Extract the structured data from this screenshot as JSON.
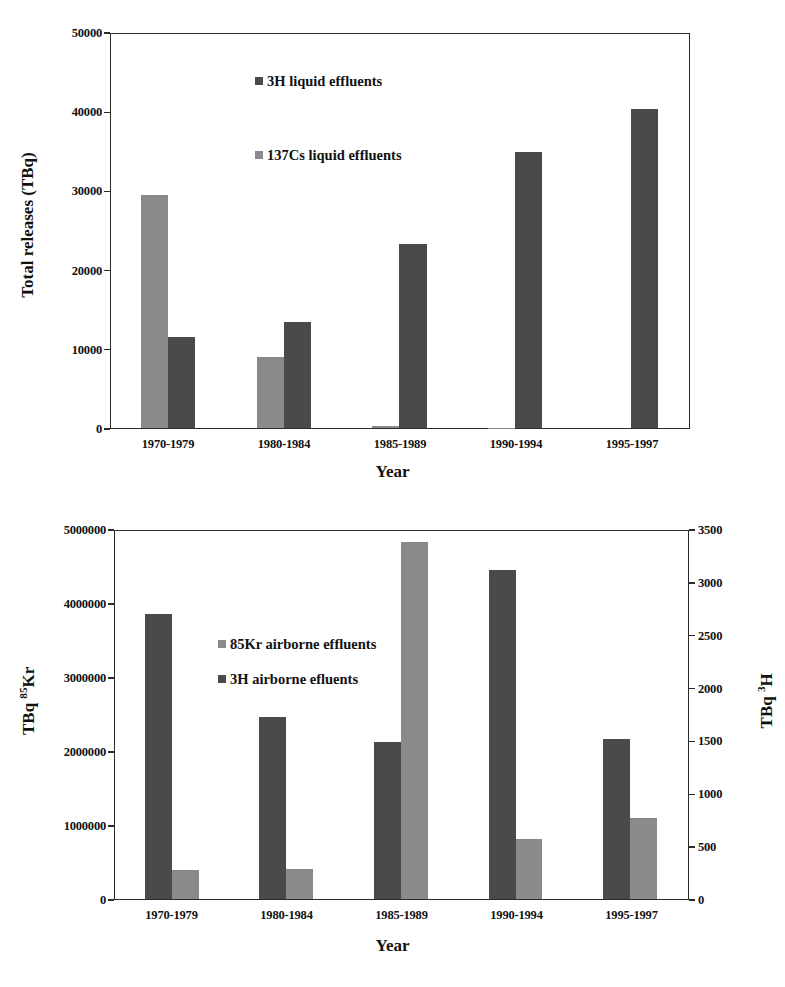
{
  "figure": {
    "accent_dark": "#4a4a4a",
    "accent_light": "#8a8a8a",
    "axis_color": "#2b2b2b"
  },
  "chart_data": [
    {
      "id": "liquid-effluents",
      "type": "bar",
      "title": "",
      "xlabel": "Year",
      "ylabel": "Total releases (TBq)",
      "categories": [
        "1970-1979",
        "1980-1984",
        "1985-1989",
        "1990-1994",
        "1995-1997"
      ],
      "ylim": [
        0,
        50000
      ],
      "yticks": [
        "0",
        "10000",
        "20000",
        "30000",
        "40000",
        "50000"
      ],
      "ytick_values": [
        0,
        10000,
        20000,
        30000,
        40000,
        50000
      ],
      "grid": false,
      "legend_position": "inside-top-left",
      "series": [
        {
          "name": "3H liquid effluents",
          "color": "#4a4a4a",
          "axis": "left",
          "values": [
            11600,
            13500,
            23400,
            35000,
            40500
          ]
        },
        {
          "name": "137Cs liquid effluents",
          "color": "#8a8a8a",
          "axis": "left",
          "values": [
            29600,
            9000,
            300,
            50,
            0
          ]
        }
      ]
    },
    {
      "id": "airborne-effluents",
      "type": "bar",
      "title": "",
      "xlabel": "Year",
      "ylabel_left": "TBq 85Kr",
      "ylabel_left_base": "TBq ",
      "ylabel_left_sup": "85",
      "ylabel_left_tail": "Kr",
      "ylabel_right": "TBq 3H",
      "ylabel_right_base": "TBq ",
      "ylabel_right_sup": "3",
      "ylabel_right_tail": "H",
      "categories": [
        "1970-1979",
        "1980-1984",
        "1985-1989",
        "1990-1994",
        "1995-1997"
      ],
      "ylim_left": [
        0,
        5000000
      ],
      "ylim_right": [
        0,
        3500
      ],
      "yticks_left": [
        "0",
        "1000000",
        "2000000",
        "3000000",
        "4000000",
        "5000000"
      ],
      "ytick_values_left": [
        0,
        1000000,
        2000000,
        3000000,
        4000000,
        5000000
      ],
      "yticks_right": [
        "0",
        "500",
        "1000",
        "1500",
        "2000",
        "2500",
        "3000",
        "3500"
      ],
      "ytick_values_right": [
        0,
        500,
        1000,
        1500,
        2000,
        2500,
        3000,
        3500
      ],
      "grid": false,
      "legend_position": "inside-top-left",
      "series": [
        {
          "name": "3H airborne efluents",
          "color": "#4a4a4a",
          "axis": "left",
          "values": [
            3870000,
            2470000,
            2130000,
            4470000,
            2180000
          ]
        },
        {
          "name": "85Kr airborne effluents",
          "color": "#8a8a8a",
          "axis": "right",
          "values": [
            280,
            290,
            3400,
            575,
            770
          ]
        }
      ]
    }
  ],
  "charts": {
    "top": {
      "legend": [
        {
          "label": "3H liquid effluents",
          "swatch": "dark"
        },
        {
          "label": "137Cs liquid effluents",
          "swatch": "light"
        }
      ],
      "ylabel": "Total releases (TBq)",
      "xlabel": "Year",
      "yticks": [
        "50000",
        "40000",
        "30000",
        "20000",
        "10000",
        "0"
      ],
      "xticks": [
        "1970-1979",
        "1980-1984",
        "1985-1989",
        "1990-1994",
        "1995-1997"
      ]
    },
    "bottom": {
      "legend": [
        {
          "label": "85Kr airborne effluents",
          "swatch": "light"
        },
        {
          "label": "3H airborne efluents",
          "swatch": "dark"
        }
      ],
      "ylabel_left_base": "TBq ",
      "ylabel_left_sup": "85",
      "ylabel_left_tail": "Kr",
      "ylabel_right_base": "TBq ",
      "ylabel_right_sup": "3",
      "ylabel_right_tail": "H",
      "xlabel": "Year",
      "yticks_left": [
        "5000000",
        "4000000",
        "3000000",
        "2000000",
        "1000000",
        "0"
      ],
      "yticks_right": [
        "3500",
        "3000",
        "2500",
        "2000",
        "1500",
        "1000",
        "500",
        "0"
      ],
      "xticks": [
        "1970-1979",
        "1980-1984",
        "1985-1989",
        "1990-1994",
        "1995-1997"
      ]
    }
  }
}
